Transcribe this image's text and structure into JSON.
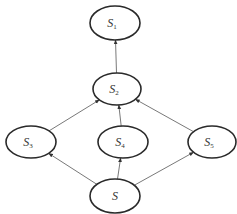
{
  "diagram": {
    "type": "directed-graph",
    "colors": {
      "stroke": "#2a2a2a",
      "edge": "#555555",
      "text": "#333333",
      "background": "#ffffff"
    },
    "nodes": [
      {
        "id": "S1",
        "base": "S",
        "sub": "1",
        "cx": 115,
        "cy": 23,
        "rx": 25,
        "ry": 17
      },
      {
        "id": "S2",
        "base": "S",
        "sub": "2",
        "cx": 117,
        "cy": 89,
        "rx": 24,
        "ry": 16
      },
      {
        "id": "S3",
        "base": "S",
        "sub": "3",
        "cx": 31,
        "cy": 142,
        "rx": 25,
        "ry": 16
      },
      {
        "id": "S4",
        "base": "S",
        "sub": "4",
        "cx": 123,
        "cy": 142,
        "rx": 25,
        "ry": 16
      },
      {
        "id": "S5",
        "base": "S",
        "sub": "5",
        "cx": 212,
        "cy": 142,
        "rx": 24,
        "ry": 16
      },
      {
        "id": "S",
        "base": "S",
        "sub": "",
        "cx": 115,
        "cy": 196,
        "rx": 25,
        "ry": 17
      }
    ],
    "edges": [
      {
        "from": "S",
        "to": "S3"
      },
      {
        "from": "S",
        "to": "S4"
      },
      {
        "from": "S",
        "to": "S5"
      },
      {
        "from": "S3",
        "to": "S2"
      },
      {
        "from": "S4",
        "to": "S2"
      },
      {
        "from": "S5",
        "to": "S2"
      },
      {
        "from": "S2",
        "to": "S1"
      }
    ]
  }
}
